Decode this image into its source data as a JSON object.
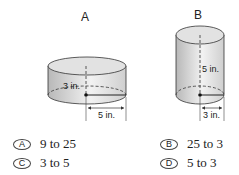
{
  "figures": {
    "a": {
      "label": "A",
      "height_label": "3 in.",
      "radius_label": "5 in."
    },
    "b": {
      "label": "B",
      "height_label": "5 in.",
      "radius_label": "3 in."
    }
  },
  "choices": [
    {
      "letter": "A",
      "text": "9 to 25"
    },
    {
      "letter": "B",
      "text": "25 to 3"
    },
    {
      "letter": "C",
      "text": "3 to 5"
    },
    {
      "letter": "D",
      "text": "5 to 3"
    }
  ]
}
